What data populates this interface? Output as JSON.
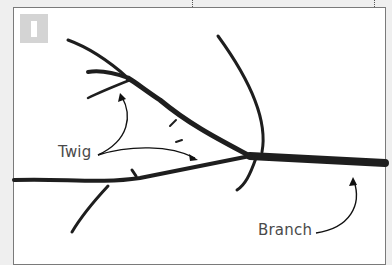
{
  "figure": {
    "number": "1",
    "labels": {
      "twig": "Twig",
      "branch": "Branch"
    },
    "colors": {
      "page_background": "#efefef",
      "panel_background": "#ffffff",
      "badge": "#d4d4d4",
      "stem": "#1e1e1e",
      "label_text": "#4a4a4a"
    }
  }
}
